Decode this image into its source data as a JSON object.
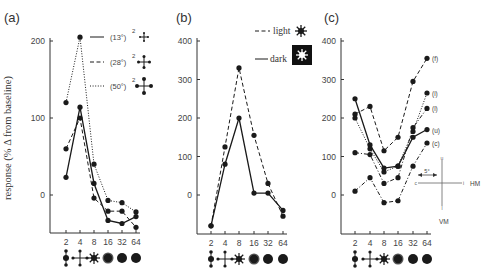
{
  "figure": {
    "ylabel": "response (% Δ from baseline)",
    "x_tick_labels": [
      "2",
      "4",
      "8",
      "16",
      "32",
      "64"
    ],
    "x_tick_icons": [
      "dot-pair-vertical-icon",
      "cross-plus-icon",
      "starburst-icon",
      "blurred-disk-icon",
      "filled-disk-icon",
      "filled-disk-icon"
    ]
  },
  "chart_data": [
    {
      "panel": "(a)",
      "type": "line",
      "title": "(a)",
      "xlabel": "",
      "ylabel": "response (% Δ from baseline)",
      "categories": [
        "2",
        "4",
        "8",
        "16",
        "32",
        "64"
      ],
      "yticks": [
        0,
        100,
        200
      ],
      "ylim": [
        -50,
        200
      ],
      "grid": false,
      "legend_position": "top-right",
      "series": [
        {
          "name": "(13°)²",
          "style": "solid",
          "values": [
            23,
            114,
            15,
            -33,
            -37,
            -28
          ]
        },
        {
          "name": "(28°)²",
          "style": "dashed",
          "values": [
            60,
            100,
            -4,
            -21,
            -21,
            -42
          ]
        },
        {
          "name": "(50°)²",
          "style": "dotted",
          "values": [
            120,
            205,
            40,
            -7,
            -10,
            -22
          ]
        }
      ]
    },
    {
      "panel": "(b)",
      "type": "line",
      "title": "(b)",
      "xlabel": "",
      "ylabel": "",
      "categories": [
        "2",
        "4",
        "8",
        "16",
        "32",
        "64"
      ],
      "yticks": [
        0,
        100,
        200,
        300,
        400
      ],
      "ylim": [
        -100,
        400
      ],
      "grid": false,
      "legend_position": "top-right",
      "series": [
        {
          "name": "light",
          "style": "dashed",
          "values": [
            -80,
            125,
            330,
            155,
            30,
            -55
          ]
        },
        {
          "name": "dark",
          "style": "solid",
          "values": [
            -80,
            80,
            200,
            5,
            5,
            -40
          ]
        }
      ]
    },
    {
      "panel": "(c)",
      "type": "line",
      "title": "(c)",
      "xlabel": "",
      "ylabel": "",
      "categories": [
        "2",
        "4",
        "8",
        "16",
        "32",
        "64"
      ],
      "yticks": [
        0,
        100,
        200,
        300,
        400
      ],
      "ylim": [
        -100,
        400
      ],
      "grid": false,
      "legend_position": "inline-right",
      "series": [
        {
          "name": "(f)",
          "style": "dashed",
          "values": [
            210,
            230,
            115,
            150,
            295,
            355
          ]
        },
        {
          "name": "(i)",
          "style": "dotted",
          "values": [
            200,
            120,
            60,
            75,
            165,
            265
          ]
        },
        {
          "name": "(l)",
          "style": "dashdot",
          "values": [
            110,
            105,
            30,
            45,
            175,
            225
          ]
        },
        {
          "name": "(u)",
          "style": "solid",
          "values": [
            250,
            130,
            70,
            75,
            150,
            170
          ]
        },
        {
          "name": "(c)",
          "style": "dashdot",
          "values": [
            10,
            45,
            -20,
            -15,
            75,
            135
          ]
        }
      ],
      "inset": {
        "scale_label": "5°",
        "horizontal_label": "HM",
        "vertical_label": "VM",
        "tick_labels": [
          "u",
          "c",
          "i",
          "l"
        ]
      }
    }
  ],
  "legends": {
    "a": [
      {
        "label": "(13°)",
        "sup": "2",
        "style": "solid",
        "icon": "small-cross-icon"
      },
      {
        "label": "(28°)",
        "sup": "2",
        "style": "dashed",
        "icon": "medium-cross-icon"
      },
      {
        "label": "(50°)",
        "sup": "2",
        "style": "dotted",
        "icon": "large-cross-icon"
      }
    ],
    "b": [
      {
        "label": "light",
        "style": "dashed",
        "icon": "starburst-icon"
      },
      {
        "label": "dark",
        "style": "solid",
        "icon": "inverted-starburst-icon"
      }
    ]
  }
}
